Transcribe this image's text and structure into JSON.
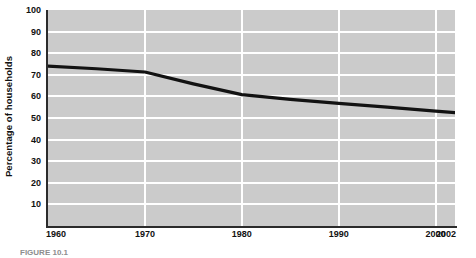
{
  "chart_data": {
    "type": "line",
    "title": "",
    "xlabel": "",
    "ylabel": "Percentage of households",
    "xlim": [
      1960,
      2002
    ],
    "ylim": [
      0,
      100
    ],
    "grid": true,
    "legend": false,
    "xticks": [
      "1960",
      "1970",
      "1980",
      "1990",
      "2000",
      "2002"
    ],
    "xtick_values": [
      1960,
      1970,
      1980,
      1990,
      2000,
      2002
    ],
    "yticks": [
      "100",
      "90",
      "80",
      "70",
      "60",
      "50",
      "40",
      "30",
      "20",
      "10"
    ],
    "ytick_values": [
      100,
      90,
      80,
      70,
      60,
      50,
      40,
      30,
      20,
      10
    ],
    "x": [
      1960,
      1965,
      1970,
      1975,
      1980,
      1985,
      1990,
      1995,
      2000,
      2002
    ],
    "values": [
      74.0,
      72.8,
      71.3,
      65.8,
      60.8,
      58.6,
      56.8,
      55.0,
      53.2,
      52.5
    ],
    "series": [
      {
        "name": "Percentage of households",
        "color": "#121212",
        "values": [
          74.0,
          72.8,
          71.3,
          65.8,
          60.8,
          58.6,
          56.8,
          55.0,
          53.2,
          52.5
        ]
      }
    ],
    "plot_background_color": "#cbcbcb",
    "gridline_color": "#ffffff",
    "axis_color": "#2b2b2b"
  },
  "caption": {
    "text": "FIGURE 10.1"
  }
}
